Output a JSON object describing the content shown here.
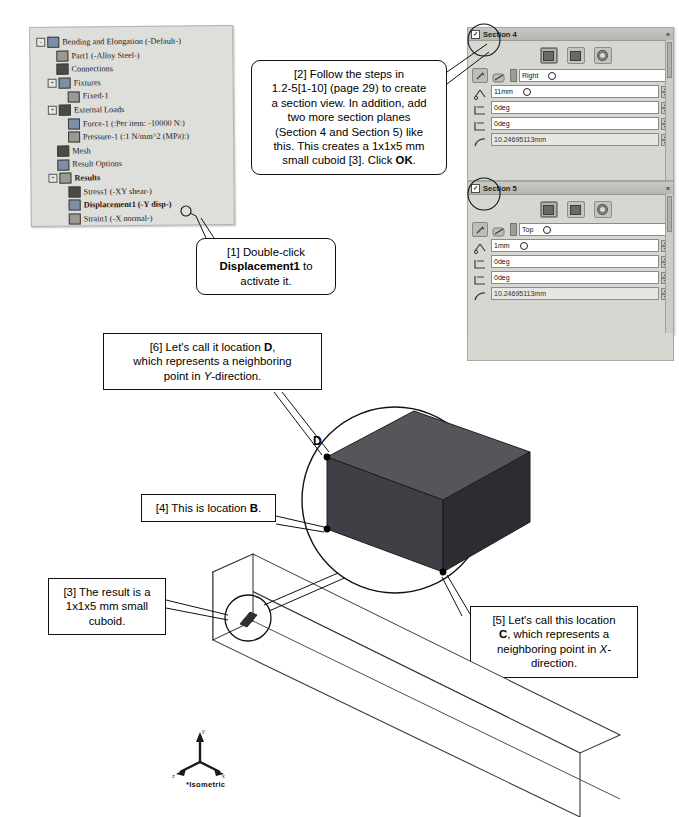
{
  "tree": {
    "items": [
      {
        "label": "Bending and Elongation (-Default-)",
        "indent": 0,
        "icon": "study-icon",
        "expander": "-",
        "bold": false
      },
      {
        "label": "Part1 (-Alloy Steel-)",
        "indent": 1,
        "icon": "part-icon",
        "expander": "",
        "bold": false
      },
      {
        "label": "Connections",
        "indent": 1,
        "icon": "connections-icon",
        "expander": "",
        "bold": false
      },
      {
        "label": "Fixtures",
        "indent": 1,
        "icon": "fixtures-icon",
        "expander": "+",
        "bold": false
      },
      {
        "label": "Fixed-1",
        "indent": 2,
        "icon": "fixed-icon",
        "expander": "",
        "bold": false
      },
      {
        "label": "External Loads",
        "indent": 1,
        "icon": "loads-icon",
        "expander": "+",
        "bold": false
      },
      {
        "label": "Force-1 (:Per item: -10000 N:)",
        "indent": 2,
        "icon": "force-icon",
        "expander": "",
        "bold": false
      },
      {
        "label": "Pressure-1 (:1 N/mm^2 (MPa):)",
        "indent": 2,
        "icon": "pressure-icon",
        "expander": "",
        "bold": false
      },
      {
        "label": "Mesh",
        "indent": 1,
        "icon": "mesh-icon",
        "expander": "",
        "bold": false
      },
      {
        "label": "Result Options",
        "indent": 1,
        "icon": "result-options-icon",
        "expander": "",
        "bold": false
      },
      {
        "label": "Results",
        "indent": 1,
        "icon": "results-icon",
        "expander": "+",
        "bold": true
      },
      {
        "label": "Stress1 (-XY shear-)",
        "indent": 2,
        "icon": "stress-icon",
        "expander": "",
        "bold": false
      },
      {
        "label": "Displacement1 (-Y disp-)",
        "indent": 2,
        "icon": "displacement-icon",
        "expander": "",
        "bold": true
      },
      {
        "label": "Strain1 (-X normal-)",
        "indent": 2,
        "icon": "strain-icon",
        "expander": "",
        "bold": false
      }
    ]
  },
  "callouts": {
    "step1": {
      "lines": [
        {
          "text": "[1] Double-click",
          "bold": false
        },
        {
          "text": "Displacement1",
          "bold": true,
          "suffix": " to"
        },
        {
          "text": "activate it.",
          "bold": false
        }
      ]
    },
    "step2": {
      "line1": "[2] Follow the steps in",
      "line2": "1.2-5[1-10] (page 29) to create",
      "line3": "a section view.  In addition, add",
      "line4": "two more section planes",
      "line5": "(Section 4 and Section 5) like",
      "line6": "this. This creates a  1x1x5 mm",
      "line7_a": "small cuboid [3].  Click ",
      "line7_b": "OK",
      "line7_c": "."
    },
    "step3": {
      "line1": "[3] The result is a",
      "line2": "1x1x5 mm small",
      "line3": "cuboid."
    },
    "step4": {
      "prefix": "[4] This is location ",
      "bold": "B",
      "suffix": "."
    },
    "step5": {
      "line1": "[5] Let's call this location",
      "line2_b": "C",
      "line2_rest": ", which represents a",
      "line3": "neighboring point in ",
      "line3_i": "X-",
      "line4": "direction."
    },
    "step6": {
      "line1_a": "[6] Let's call it location ",
      "line1_b": "D",
      "line1_c": ",",
      "line2": "which represents a neighboring",
      "line3": "point in ",
      "line3_i": "Y",
      "line3_b": "-direction."
    }
  },
  "panels": [
    {
      "title": "Section 4",
      "checkbox": "✓",
      "collapse_icon": "chevron-up-icon",
      "toolbar_icons": [
        "section-plane-icon",
        "section-zebra-icon",
        "section-round-icon"
      ],
      "rows": [
        {
          "kind": "reference",
          "value": "Right",
          "has_dot": true,
          "has_spin": false
        },
        {
          "kind": "offset",
          "value": "11mm",
          "has_dot": true,
          "has_spin": true
        },
        {
          "kind": "rotate-x",
          "value": "0deg",
          "has_dot": false,
          "has_spin": true
        },
        {
          "kind": "rotate-y",
          "value": "0deg",
          "has_dot": false,
          "has_spin": true
        },
        {
          "kind": "arc",
          "value": "10.24695113mm",
          "has_dot": false,
          "has_spin": true
        }
      ]
    },
    {
      "title": "Section 5",
      "checkbox": "✓",
      "collapse_icon": "chevron-up-icon",
      "toolbar_icons": [
        "section-plane-icon",
        "section-zebra-icon",
        "section-round-icon"
      ],
      "rows": [
        {
          "kind": "reference",
          "value": "Top",
          "has_dot": true,
          "has_spin": false
        },
        {
          "kind": "offset",
          "value": "1mm",
          "has_dot": true,
          "has_spin": true
        },
        {
          "kind": "rotate-x",
          "value": "0deg",
          "has_dot": false,
          "has_spin": true
        },
        {
          "kind": "rotate-y",
          "value": "0deg",
          "has_dot": false,
          "has_spin": true
        },
        {
          "kind": "arc",
          "value": "10.24695113mm",
          "has_dot": false,
          "has_spin": true
        }
      ]
    }
  ],
  "diagram": {
    "point_b": "B",
    "point_c": "C",
    "point_d": "D",
    "view_label": "*Isometric",
    "axis_x": "x",
    "axis_y": "y",
    "axis_z": "z",
    "cuboid_top_color": "#55555a",
    "cuboid_front_color": "#3a3a40",
    "cuboid_side_color": "#2b2b30"
  }
}
